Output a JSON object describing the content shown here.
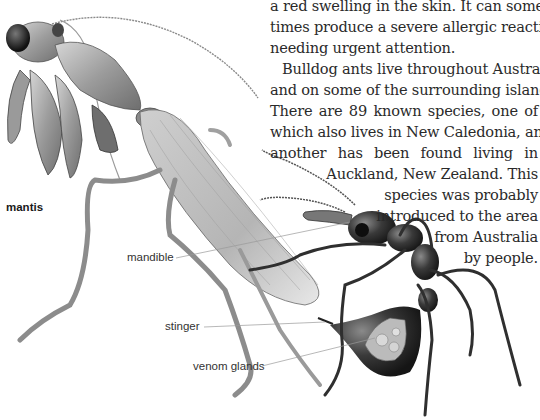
{
  "body_text": {
    "lines": [
      "a red swelling in the skin. It can some-",
      "times produce a severe allergic reaction",
      "needing urgent attention.",
      "Bulldog ants live throughout Australia",
      "and on some of the surrounding islands.",
      "There are 89 known species, one of",
      "which also lives in New Caledonia, and",
      "another has been found living in",
      "Auckland, New Zealand. This",
      "species was probably",
      "introduced to the area",
      "from Australia",
      "by people."
    ]
  },
  "illustration": {
    "subjects": [
      "praying-mantis",
      "bulldog-ant"
    ],
    "labels": {
      "mantis": "mantis",
      "mandible": "mandible",
      "stinger": "stinger",
      "venom_glands": "venom glands"
    }
  },
  "colors": {
    "background": "#ffffff",
    "text": "#2a2a2a",
    "label": "#333333",
    "leader_line": "#9a9a9a",
    "ant_body": "#2b2b2b",
    "mantis_body": "#a8a8a8"
  }
}
